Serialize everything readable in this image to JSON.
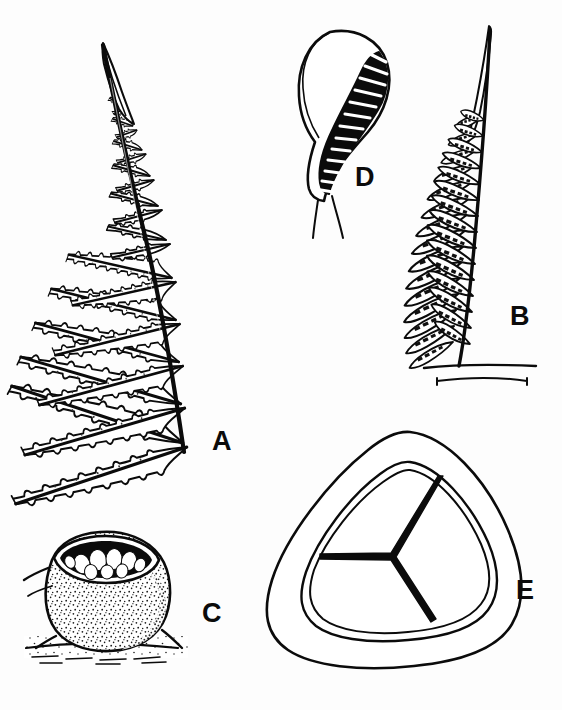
{
  "plate": {
    "title": "Fern morphology illustration plate",
    "subject": "fern",
    "background_color": "#fdfdfd",
    "ink_color": "#0b0b0b",
    "width": 562,
    "height": 710,
    "style": "line drawing, black ink on white"
  },
  "panels": [
    {
      "id": "A",
      "label": "A",
      "name": "frond",
      "description": "Pinnate fern frond with deeply lobed pinnae and crenate-undulate margins",
      "label_x": 212,
      "label_y": 428
    },
    {
      "id": "B",
      "label": "B",
      "name": "fertile-pinna",
      "description": "Fertile pinna bearing marginal sori along the segments",
      "label_x": 510,
      "label_y": 303
    },
    {
      "id": "C",
      "label": "C",
      "name": "indusium-with-sporangia",
      "description": "Cup-shaped indusium containing sporangia, on stippled leaf surface",
      "label_x": 202,
      "label_y": 600
    },
    {
      "id": "D",
      "label": "D",
      "name": "sporangium",
      "description": "Sporangium with banded annulus and stalk",
      "label_x": 355,
      "label_y": 164
    },
    {
      "id": "E",
      "label": "E",
      "name": "trilete-spore",
      "description": "Trilete spore, triangular in polar view, with Y-shaped laesura",
      "label_x": 516,
      "label_y": 577
    }
  ]
}
